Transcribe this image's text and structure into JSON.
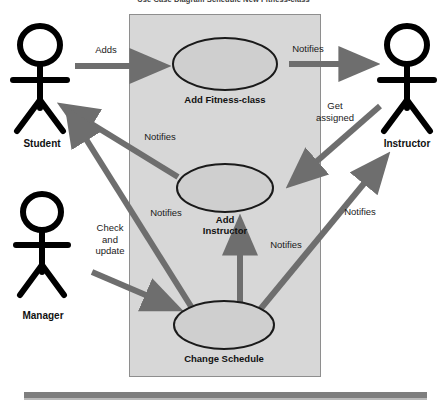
{
  "diagram": {
    "title": "Use Case Diagram Schedule New Fitness-class",
    "type": "uml-use-case-diagram",
    "colors": {
      "system_box_fill": "#d7d7d7",
      "system_box_stroke": "#8e8e8e",
      "usecase_fill": "#cfcfcf",
      "usecase_stroke": "#1a1a1a",
      "arrow": "#6e6e6e",
      "actor": "#000000",
      "bottom_bar": "#7e7e7e",
      "page_background": "#ffffff"
    },
    "actors": [
      {
        "id": "student",
        "label": "Student"
      },
      {
        "id": "instructor",
        "label": "Instructor"
      },
      {
        "id": "manager",
        "label": "Manager"
      }
    ],
    "use_cases": [
      {
        "id": "add-fitness-class",
        "label": "Add Fitness-class"
      },
      {
        "id": "add-instructor",
        "label": "Add\nInstructor"
      },
      {
        "id": "change-schedule",
        "label": "Change Schedule"
      }
    ],
    "edges": [
      {
        "id": "adds",
        "label": "Adds",
        "from": "student",
        "to": "add-fitness-class"
      },
      {
        "id": "notifies-instructor",
        "label": "Notifies",
        "from": "add-fitness-class",
        "to": "instructor"
      },
      {
        "id": "get-assigned",
        "label": "Get\nassigned",
        "from": "instructor",
        "to": "add-instructor"
      },
      {
        "id": "notifies-student-1",
        "label": "Notifies",
        "from": "add-instructor",
        "to": "student"
      },
      {
        "id": "notifies-student-2",
        "label": "Notifies",
        "from": "change-schedule",
        "to": "student"
      },
      {
        "id": "check-and-update",
        "label": "Check\nand\nupdate",
        "from": "manager",
        "to": "change-schedule"
      },
      {
        "id": "notifies-add-instructor",
        "label": "Notifies",
        "from": "change-schedule",
        "to": "add-instructor"
      },
      {
        "id": "notifies-instructor-2",
        "label": "Notifies",
        "from": "change-schedule",
        "to": "instructor"
      }
    ]
  }
}
